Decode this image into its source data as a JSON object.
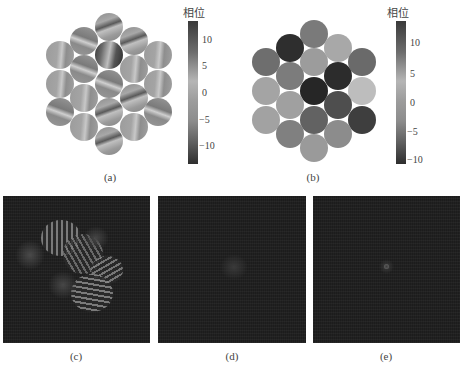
{
  "figure": {
    "panel_a": {
      "caption": "(a)",
      "colorbar": {
        "title": "相位",
        "ticks": [
          "10",
          "5",
          "0",
          "−5",
          "−10"
        ]
      },
      "circles": [
        {
          "x": 109,
          "y": 27,
          "g": "s1"
        },
        {
          "x": 84,
          "y": 41,
          "g": "s2"
        },
        {
          "x": 134,
          "y": 41,
          "g": "s1"
        },
        {
          "x": 60,
          "y": 55,
          "g": "s3"
        },
        {
          "x": 109,
          "y": 55,
          "g": "s4"
        },
        {
          "x": 158,
          "y": 55,
          "g": "s3"
        },
        {
          "x": 84,
          "y": 69,
          "g": "s2"
        },
        {
          "x": 134,
          "y": 69,
          "g": "s3"
        },
        {
          "x": 60,
          "y": 84,
          "g": "s3"
        },
        {
          "x": 109,
          "y": 84,
          "g": "s2"
        },
        {
          "x": 158,
          "y": 84,
          "g": "s3"
        },
        {
          "x": 84,
          "y": 98,
          "g": "s3"
        },
        {
          "x": 134,
          "y": 98,
          "g": "s1"
        },
        {
          "x": 60,
          "y": 112,
          "g": "s2"
        },
        {
          "x": 109,
          "y": 112,
          "g": "s1"
        },
        {
          "x": 158,
          "y": 112,
          "g": "s2"
        },
        {
          "x": 84,
          "y": 127,
          "g": "s3"
        },
        {
          "x": 134,
          "y": 127,
          "g": "s3"
        },
        {
          "x": 109,
          "y": 141,
          "g": "s1"
        }
      ]
    },
    "panel_b": {
      "caption": "(b)",
      "colorbar": {
        "title": "相位",
        "ticks": [
          "10",
          "5",
          "0",
          "−5",
          "−10"
        ]
      },
      "circles": [
        {
          "x": 314,
          "y": 34,
          "c": "#7a7a7a"
        },
        {
          "x": 290,
          "y": 48,
          "c": "#2e2e2e"
        },
        {
          "x": 338,
          "y": 48,
          "c": "#a8a8a8"
        },
        {
          "x": 266,
          "y": 62,
          "c": "#6e6e6e"
        },
        {
          "x": 314,
          "y": 62,
          "c": "#9c9c9c"
        },
        {
          "x": 362,
          "y": 62,
          "c": "#6a6a6a"
        },
        {
          "x": 290,
          "y": 76,
          "c": "#7c7c7c"
        },
        {
          "x": 338,
          "y": 76,
          "c": "#2c2c2c"
        },
        {
          "x": 266,
          "y": 91,
          "c": "#a4a4a4"
        },
        {
          "x": 314,
          "y": 91,
          "c": "#262626"
        },
        {
          "x": 362,
          "y": 91,
          "c": "#bdbdbd"
        },
        {
          "x": 290,
          "y": 105,
          "c": "#a0a0a0"
        },
        {
          "x": 338,
          "y": 105,
          "c": "#4e4e4e"
        },
        {
          "x": 266,
          "y": 120,
          "c": "#a2a2a2"
        },
        {
          "x": 314,
          "y": 120,
          "c": "#626262"
        },
        {
          "x": 362,
          "y": 120,
          "c": "#3e3e3e"
        },
        {
          "x": 290,
          "y": 134,
          "c": "#808080"
        },
        {
          "x": 338,
          "y": 134,
          "c": "#8c8c8c"
        },
        {
          "x": 314,
          "y": 148,
          "c": "#9a9a9a"
        }
      ]
    },
    "panel_c": {
      "caption": "(c)"
    },
    "panel_d": {
      "caption": "(d)"
    },
    "panel_e": {
      "caption": "(e)"
    }
  }
}
